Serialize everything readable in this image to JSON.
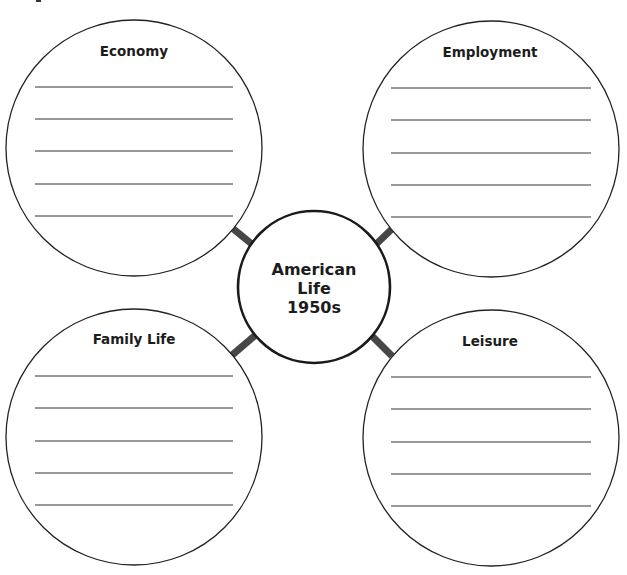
{
  "diagram": {
    "type": "web-organizer",
    "center": {
      "lines": [
        "American",
        "Life",
        "1950s"
      ]
    },
    "topics": [
      {
        "position": "top-left",
        "title": "Economy",
        "answer_lines": 5
      },
      {
        "position": "top-right",
        "title": "Employment",
        "answer_lines": 5
      },
      {
        "position": "bottom-left",
        "title": "Family Life",
        "answer_lines": 5
      },
      {
        "position": "bottom-right",
        "title": "Leisure",
        "answer_lines": 5
      }
    ],
    "colors": {
      "background": "#ffffff",
      "outline": "#222222",
      "connector": "#474747",
      "text": "#1c1c1c"
    }
  }
}
